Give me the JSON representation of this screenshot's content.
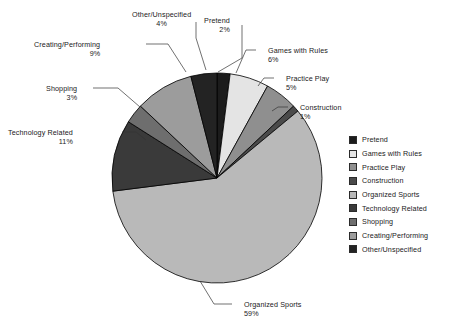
{
  "chart_data": {
    "type": "pie",
    "title": "",
    "legend_position": "right",
    "categories": [
      "Pretend",
      "Games with Rules",
      "Practice Play",
      "Construction",
      "Organized Sports",
      "Technology Related",
      "Shopping",
      "Creating/Performing",
      "Other/Unspecified"
    ],
    "values": [
      2,
      6,
      5,
      1,
      59,
      11,
      3,
      9,
      4
    ],
    "value_labels": [
      "2%",
      "6%",
      "5%",
      "1%",
      "59%",
      "11%",
      "3%",
      "9%",
      "4%"
    ],
    "colors": [
      "#1c1c1c",
      "#e4e4e4",
      "#8f8f8f",
      "#4a4a4a",
      "#b9b9b9",
      "#3a3a3a",
      "#6e6e6e",
      "#9c9c9c",
      "#232323"
    ]
  },
  "pie": {
    "center_x": 217,
    "center_y": 178,
    "radius": 105,
    "start_angle_deg": -90,
    "stroke": "#000000"
  },
  "callouts": [
    {
      "name": "Pretend",
      "pct": "2%",
      "align": "lab-left",
      "x": 204,
      "y": 16,
      "leader": [
        [
          242,
          25
        ],
        [
          242,
          58
        ],
        [
          218,
          72
        ]
      ]
    },
    {
      "name": "Games with Rules",
      "pct": "6%",
      "align": "lab-right",
      "x": 268,
      "y": 46,
      "leader": [
        [
          256,
          50
        ],
        [
          246,
          50
        ],
        [
          236,
          73
        ]
      ]
    },
    {
      "name": "Practice Play",
      "pct": "5%",
      "align": "lab-right",
      "x": 286,
      "y": 74,
      "leader": [
        [
          274,
          78
        ],
        [
          264,
          78
        ],
        [
          258,
          86
        ]
      ]
    },
    {
      "name": "Construction",
      "pct": "1%",
      "align": "lab-right",
      "x": 300,
      "y": 103,
      "leader": [
        [
          288,
          107
        ],
        [
          278,
          107
        ],
        [
          272,
          111
        ]
      ]
    },
    {
      "name": "Organized Sports",
      "pct": "59%",
      "align": "lab-right",
      "x": 244,
      "y": 300,
      "leader": [
        [
          232,
          304
        ],
        [
          214,
          304
        ],
        [
          200,
          281
        ]
      ]
    },
    {
      "name": "Technology Related",
      "pct": "11%",
      "align": "lab-left",
      "x": 8,
      "y": 128,
      "leader": [
        [
          122,
          132
        ],
        [
          136,
          132
        ],
        [
          146,
          140
        ]
      ]
    },
    {
      "name": "Shopping",
      "pct": "3%",
      "align": "lab-left",
      "x": 46,
      "y": 84,
      "leader": [
        [
          93,
          88
        ],
        [
          118,
          88
        ],
        [
          140,
          107
        ]
      ]
    },
    {
      "name": "Creating/Performing",
      "pct": "9%",
      "align": "lab-left",
      "x": 34,
      "y": 40,
      "leader": [
        [
          146,
          44
        ],
        [
          168,
          44
        ],
        [
          186,
          72
        ]
      ]
    },
    {
      "name": "Other/Unspecified",
      "pct": "4%",
      "align": "lab-center",
      "x": 132,
      "y": 10,
      "leader": [
        [
          196,
          22
        ],
        [
          196,
          38
        ],
        [
          206,
          70
        ]
      ]
    }
  ],
  "legend": {
    "items": [
      {
        "label": "Pretend",
        "color": "#1c1c1c"
      },
      {
        "label": "Games with Rules",
        "color": "#e4e4e4"
      },
      {
        "label": "Practice Play",
        "color": "#8f8f8f"
      },
      {
        "label": "Construction",
        "color": "#4a4a4a"
      },
      {
        "label": "Organized Sports",
        "color": "#b9b9b9"
      },
      {
        "label": "Technology Related",
        "color": "#3a3a3a"
      },
      {
        "label": "Shopping",
        "color": "#6e6e6e"
      },
      {
        "label": "Creating/Performing",
        "color": "#9c9c9c"
      },
      {
        "label": "Other/Unspecified",
        "color": "#232323"
      }
    ]
  }
}
